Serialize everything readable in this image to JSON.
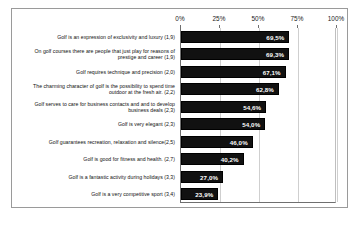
{
  "chart_data": {
    "type": "bar",
    "orientation": "horizontal",
    "title": "",
    "xlabel": "",
    "ylabel": "",
    "xlim": [
      0,
      100
    ],
    "xticks": [
      "0%",
      "25%",
      "50%",
      "75%",
      "100%"
    ],
    "xtick_values": [
      0,
      25,
      50,
      75,
      100
    ],
    "grid": true,
    "legend": "none",
    "value_label_suffix": "%",
    "categories": [
      "Golf is an expression of exclusivity and luxury (1,9)",
      "On golf courses there are people that just play for reasons of prestige and career (1,9)",
      "Golf requires technique and precision (2,0)",
      "The charming character of golf is the possibility to spend time outdoor at the fresh air. (2,2)",
      "Golf serves to care for business contacts and and to develop business deals (2,3)",
      "Golf is very elegant (2,3)",
      "Golf guarantees recreation, relaxation and silence(2,5)",
      "Golf is good for fitness and health. (2,7)",
      "Golf is a fantastic activity during holidays (3,3)",
      "Golf is a very competitive sport (3,4)"
    ],
    "values": [
      69.5,
      69.3,
      67.1,
      62.8,
      54.6,
      54.0,
      46.0,
      40.2,
      27.0,
      23.9
    ],
    "value_labels": [
      "69,5%",
      "69,3%",
      "67,1%",
      "62,8%",
      "54,6%",
      "54,0%",
      "46,0%",
      "40,2%",
      "27,0%",
      "23,9%"
    ],
    "bar_color": "#111111",
    "value_label_color": "#FFFFFF",
    "plot_background": "#FFFFFF",
    "gridline_color": "#CFCFCF"
  }
}
